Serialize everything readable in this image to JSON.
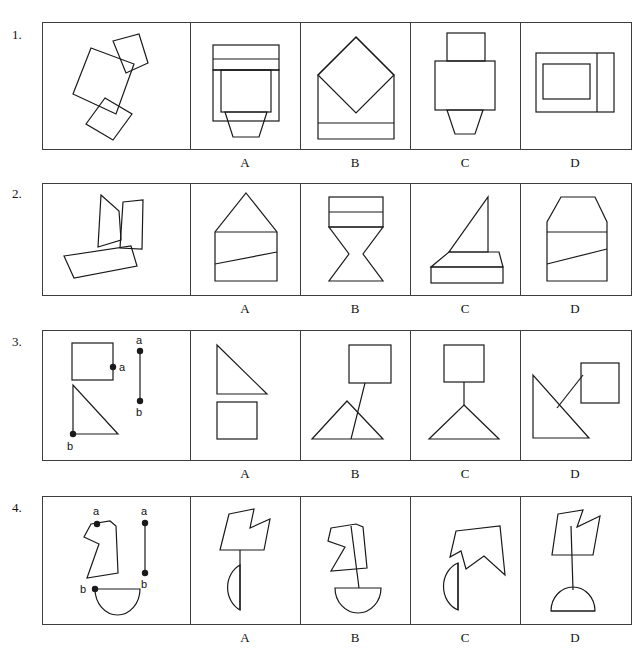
{
  "sheet": {
    "title": "Spatial Reasoning — Shape Assembly Test",
    "stroke_color": "#1a1a1a",
    "panel_border_color": "#3d3d3d",
    "background_color": "#ffffff"
  },
  "options": {
    "labels": [
      "A",
      "B",
      "C",
      "D"
    ]
  },
  "rows": [
    {
      "number": "1.",
      "stimulus_description": "Three tilted quadrilaterals: a small trapezoid top-right, a large tilted square centre, a small tilted square bottom",
      "option_labels": [
        "A",
        "B",
        "C",
        "D"
      ],
      "options": [
        {
          "label": "A",
          "description": "Banded rectangle with nested rectangle and downward trapezoid tab"
        },
        {
          "label": "B",
          "description": "Square house with large rotated diamond inside and bottom band"
        },
        {
          "label": "C",
          "description": "Stacked rectangles with a small trapezoid tab at bottom"
        },
        {
          "label": "D",
          "description": "Rectangle with nested rectangle and a vertical strip on the right"
        }
      ]
    },
    {
      "number": "2.",
      "stimulus_description": "Three tilted quadrilaterals: a trapezoid pointing left, a narrow tall quadrilateral, a long thin slanted rectangle",
      "option_labels": [
        "A",
        "B",
        "C",
        "D"
      ],
      "options": [
        {
          "label": "A",
          "description": "Pentagon house shape with a horizontal line and a slanted line"
        },
        {
          "label": "B",
          "description": "Banded rectangle above an hourglass / bowtie form"
        },
        {
          "label": "C",
          "description": "Right triangle sail on a trapezoid base above a flat rectangle"
        },
        {
          "label": "D",
          "description": "Chamfered-top rectangle with a horizontal line and a slanted line"
        }
      ]
    },
    {
      "number": "3.",
      "stimulus_description": "A square with point a on its right edge, a right triangle with point b at its bottom-left vertex, and a separate vertical connector segment labelled a (top) to b (bottom)",
      "point_labels": {
        "a": "a",
        "b": "b"
      },
      "option_labels": [
        "A",
        "B",
        "C",
        "D"
      ],
      "options": [
        {
          "label": "A",
          "description": "Right triangle directly stacked on a square, no visible connector"
        },
        {
          "label": "B",
          "description": "Square joined by a slanted segment passing through a triangle"
        },
        {
          "label": "C",
          "description": "Square connected by a vertical segment to the apex of a triangle"
        },
        {
          "label": "D",
          "description": "Right triangle with a segment reaching up to a square at right"
        }
      ]
    },
    {
      "number": "4.",
      "stimulus_description": "An arrow-notched polygon with point a at its top notch, a half-disc with point b at its top-left corner, and a separate vertical connector segment labelled a (top) to b (bottom)",
      "point_labels": {
        "a": "a",
        "b": "b"
      },
      "option_labels": [
        "A",
        "B",
        "C",
        "D"
      ],
      "options": [
        {
          "label": "A",
          "description": "Notched polygon above a left-facing half-disc joined by a vertical line"
        },
        {
          "label": "B",
          "description": "Notched polygon with a line running through it down to a half-disc"
        },
        {
          "label": "C",
          "description": "Notched polygon touching a left-facing half-disc directly"
        },
        {
          "label": "D",
          "description": "Notched polygon connected by a long vertical line to a dome half-disc"
        }
      ]
    }
  ]
}
